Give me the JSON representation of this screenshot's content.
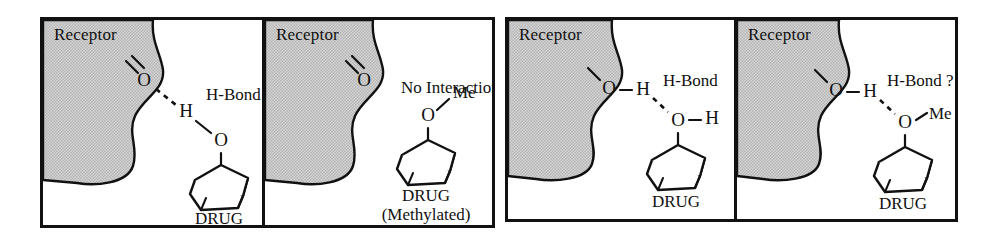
{
  "figure": {
    "background_color": "#ffffff",
    "ink_color": "#111111",
    "receptor_fill": "#c9c9c9"
  },
  "groups": [
    {
      "name": "group-a",
      "panels": [
        "panel-1",
        "panel-2"
      ]
    },
    {
      "name": "group-b",
      "panels": [
        "panel-3",
        "panel-4"
      ]
    }
  ],
  "panels": [
    {
      "id": "panel-1",
      "receptor_label": "Receptor",
      "annotation": "H-Bond",
      "receptor_group": "carbonyl",
      "receptor_atoms": [
        "O"
      ],
      "drug_atoms": [
        "H",
        "O"
      ],
      "drug_label": "DRUG",
      "drug_sublabel": "",
      "interaction": "hydrogen-bond",
      "atoms": {
        "receptor_o": "O",
        "drug_h": "H",
        "drug_o": "O"
      }
    },
    {
      "id": "panel-2",
      "receptor_label": "Receptor",
      "annotation": "No Interaction",
      "receptor_group": "carbonyl",
      "receptor_atoms": [
        "O"
      ],
      "drug_atoms": [
        "Me",
        "O"
      ],
      "drug_label": "DRUG",
      "drug_sublabel": "(Methylated)",
      "interaction": "none",
      "atoms": {
        "receptor_o": "O",
        "drug_me": "Me",
        "drug_o": "O"
      }
    },
    {
      "id": "panel-3",
      "receptor_label": "Receptor",
      "annotation": "H-Bond",
      "receptor_group": "hydroxyl",
      "receptor_atoms": [
        "O",
        "H"
      ],
      "drug_atoms": [
        "O",
        "H"
      ],
      "drug_label": "DRUG",
      "drug_sublabel": "",
      "interaction": "hydrogen-bond",
      "atoms": {
        "receptor_o": "O",
        "receptor_h": "H",
        "drug_o": "O",
        "drug_h": "H"
      }
    },
    {
      "id": "panel-4",
      "receptor_label": "Receptor",
      "annotation": "H-Bond ?",
      "receptor_group": "hydroxyl",
      "receptor_atoms": [
        "O",
        "H"
      ],
      "drug_atoms": [
        "O",
        "Me"
      ],
      "drug_label": "DRUG",
      "drug_sublabel": "",
      "interaction": "hydrogen-bond-uncertain",
      "atoms": {
        "receptor_o": "O",
        "receptor_h": "H",
        "drug_o": "O",
        "drug_me": "Me"
      }
    }
  ]
}
